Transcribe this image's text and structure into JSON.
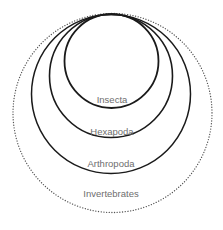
{
  "diagram": {
    "type": "nested-set-diagram",
    "colors": {
      "background": "#ffffff",
      "solid_stroke": "#1a1a1a",
      "dotted_stroke": "#555555",
      "label": "#6e6e6e"
    },
    "sets": [
      {
        "id": "invertebrates",
        "label": "Invertebrates",
        "style": "dotted",
        "cx": 112.5,
        "cy": 113,
        "r": 99.5,
        "label_y": 194
      },
      {
        "id": "arthropoda",
        "label": "Arthropoda",
        "style": "solid",
        "cx": 111,
        "cy": 94,
        "r": 79.5,
        "label_y": 164
      },
      {
        "id": "hexapoda",
        "label": "Hexapoda",
        "style": "solid",
        "cx": 111,
        "cy": 76,
        "r": 61.5,
        "label_y": 132
      },
      {
        "id": "insecta",
        "label": "Insecta",
        "style": "solid",
        "cx": 111.5,
        "cy": 61,
        "r": 47,
        "label_y": 100
      }
    ]
  }
}
